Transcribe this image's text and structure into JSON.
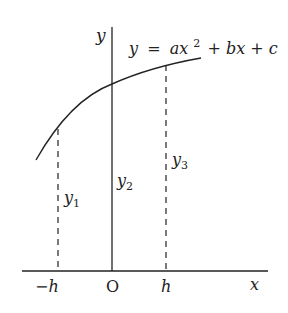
{
  "diagram": {
    "equation": {
      "lhs": "y",
      "eq": "=",
      "a": "ax",
      "exp": "2",
      "rest": "+ bx + c"
    },
    "axes": {
      "y_label": "y",
      "x_label": "x",
      "origin_label": "O"
    },
    "ticks": {
      "neg_h": "−h",
      "pos_h": "h"
    },
    "ordinates": {
      "y1": {
        "base": "y",
        "sub": "1"
      },
      "y2": {
        "base": "y",
        "sub": "2"
      },
      "y3": {
        "base": "y",
        "sub": "3"
      }
    },
    "colors": {
      "ink": "#222222",
      "background": "#ffffff"
    }
  }
}
